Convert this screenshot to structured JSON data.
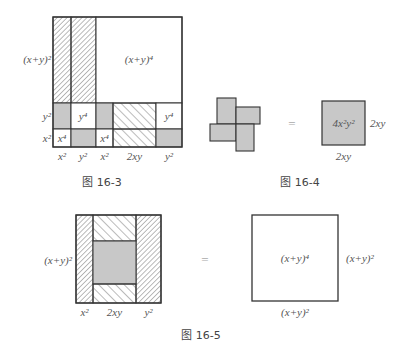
{
  "colors": {
    "line": "#333333",
    "gray_fill": "#c8c8c8",
    "hatch": "#555555",
    "text": "#555555"
  },
  "figures": [
    {
      "id": "fig-16-3",
      "caption": "图 16-3",
      "left_label": "(x+y)²",
      "big_square_label": "(x+y)⁴",
      "row_labels": [
        "y²",
        "x²"
      ],
      "column_labels": [
        "x²",
        "y²",
        "x²",
        "2xy",
        "y²"
      ],
      "cells": {
        "tall_strips": [
          "hatched",
          "hatched"
        ],
        "big_square": "blank",
        "row_y2": [
          {
            "fill": "gray",
            "text": ""
          },
          {
            "fill": "white",
            "text": "y⁴"
          },
          {
            "fill": "gray",
            "text": ""
          },
          {
            "fill": "hatched",
            "text": ""
          },
          {
            "fill": "white",
            "text": "y⁴"
          }
        ],
        "row_x2": [
          {
            "fill": "white",
            "text": "x⁴"
          },
          {
            "fill": "gray",
            "text": ""
          },
          {
            "fill": "white",
            "text": "x⁴"
          },
          {
            "fill": "hatched",
            "text": ""
          },
          {
            "fill": "gray",
            "text": ""
          }
        ]
      }
    },
    {
      "id": "fig-16-4",
      "caption": "图 16-4",
      "equals": "=",
      "square_label": "4x²y²",
      "side_label_right": "2xy",
      "side_label_bottom": "2xy",
      "pinwheel_pieces": 4
    },
    {
      "id": "fig-16-5",
      "caption": "图 16-5",
      "equals": "=",
      "left_label": "(x+y)²",
      "column_labels": [
        "x²",
        "2xy",
        "y²"
      ],
      "right_square_label": "(x+y)⁴",
      "right_side_label": "(x+y)²",
      "bottom_side_label": "(x+y)²"
    }
  ]
}
